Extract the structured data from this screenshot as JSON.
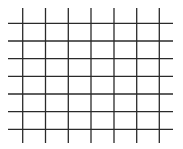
{
  "diagram": {
    "type": "grid",
    "width": 183,
    "height": 149,
    "background": "#ffffff",
    "line_color": "#2a2a2a",
    "line_width": 1.3,
    "vertical_lines": {
      "count": 7,
      "x": [
        22.7,
        45.5,
        68.3,
        91,
        114,
        136.7,
        159.3
      ],
      "y_start": 8,
      "y_end": 143
    },
    "horizontal_lines": {
      "count": 7,
      "y": [
        23.3,
        41,
        58.7,
        76.3,
        94,
        111.7,
        129.3
      ],
      "x_start": 8,
      "x_end": 173
    }
  }
}
